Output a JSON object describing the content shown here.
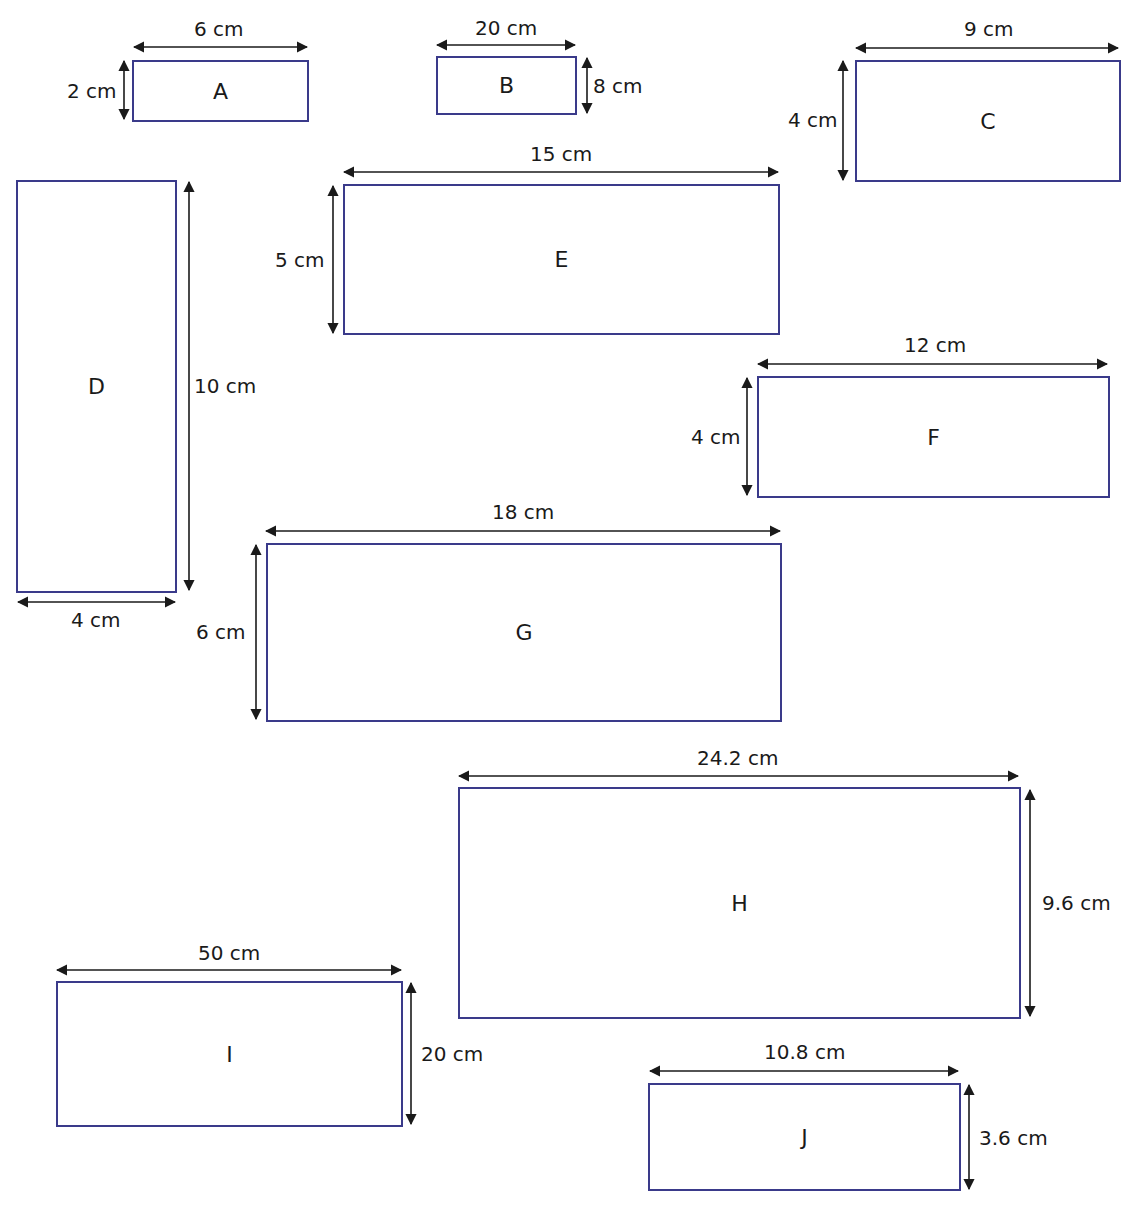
{
  "diagram": {
    "type": "rectangles-with-dimensions",
    "stroke_color": "#3a3a8a",
    "arrow_color": "#1a1a1a",
    "shapes": [
      {
        "label": "A",
        "width_label": "6 cm",
        "height_label": "2 cm"
      },
      {
        "label": "B",
        "width_label": "20 cm",
        "height_label": "8 cm"
      },
      {
        "label": "C",
        "width_label": "9 cm",
        "height_label": "4 cm"
      },
      {
        "label": "D",
        "width_label": "4 cm",
        "height_label": "10 cm"
      },
      {
        "label": "E",
        "width_label": "15 cm",
        "height_label": "5 cm"
      },
      {
        "label": "F",
        "width_label": "12 cm",
        "height_label": "4 cm"
      },
      {
        "label": "G",
        "width_label": "18 cm",
        "height_label": "6 cm"
      },
      {
        "label": "H",
        "width_label": "24.2 cm",
        "height_label": "9.6 cm"
      },
      {
        "label": "I",
        "width_label": "50 cm",
        "height_label": "20 cm"
      },
      {
        "label": "J",
        "width_label": "10.8 cm",
        "height_label": "3.6 cm"
      }
    ]
  }
}
